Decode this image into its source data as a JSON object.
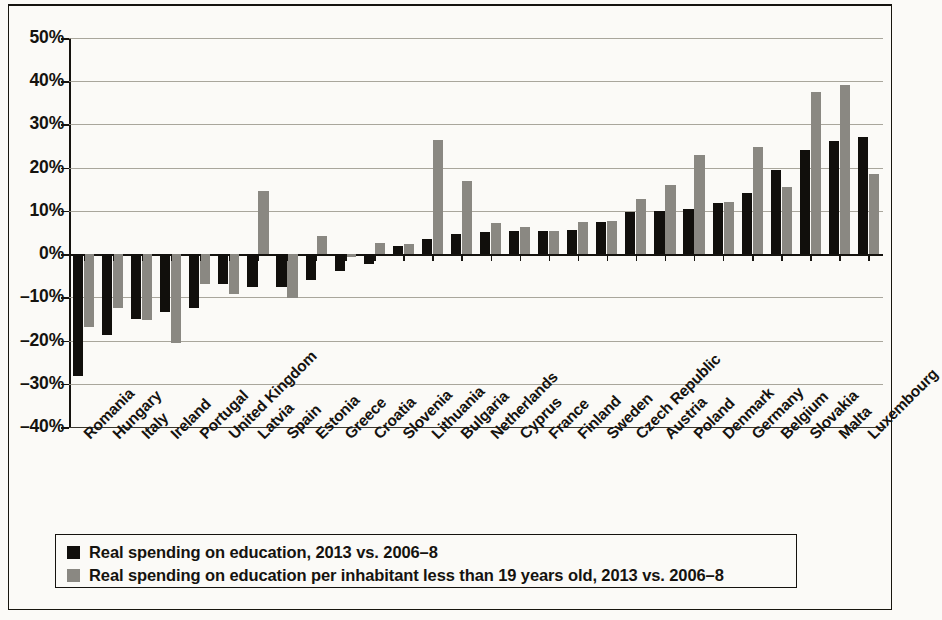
{
  "chart_data": {
    "type": "bar",
    "title": "",
    "xlabel": "",
    "ylabel": "",
    "ylim": [
      -40,
      50
    ],
    "ytick_step": 10,
    "ytick_labels": [
      "50%",
      "40%",
      "30%",
      "20%",
      "10%",
      "0%",
      "-10%",
      "-20%",
      "-30%",
      "-40%"
    ],
    "ytick_values": [
      50,
      40,
      30,
      20,
      10,
      0,
      -10,
      -20,
      -30,
      -40
    ],
    "grid": true,
    "legend_position": "bottom",
    "orientation": "vertical",
    "categories": [
      "Romania",
      "Hungary",
      "Italy",
      "Ireland",
      "Portugal",
      "United Kingdom",
      "Latvia",
      "Spain",
      "Estonia",
      "Greece",
      "Croatia",
      "Slovenia",
      "Lithuania",
      "Bulgaria",
      "Netherlands",
      "Cyprus",
      "France",
      "Finland",
      "Sweden",
      "Czech Republic",
      "Austria",
      "Poland",
      "Denmark",
      "Germany",
      "Belgium",
      "Slovakia",
      "Malta",
      "Luxembourg"
    ],
    "series": [
      {
        "name": "Real spending on education, 2013 vs. 2006-8",
        "color": "#110f0c",
        "values": [
          -28.2,
          -18.6,
          -15.0,
          -13.5,
          -12.5,
          -7.0,
          -7.5,
          -7.5,
          -6.0,
          -3.8,
          -2.3,
          1.8,
          3.5,
          4.6,
          5.1,
          5.4,
          5.4,
          5.5,
          7.4,
          9.8,
          10.0,
          10.5,
          11.9,
          14.2,
          19.4,
          24.2,
          26.1,
          27.1
        ]
      },
      {
        "name": "Real spending on education per inhabitant less than 19 years old, 2013 vs. 2006-8",
        "color": "#8a8882",
        "values": [
          -16.8,
          -12.4,
          -15.3,
          -20.6,
          -6.9,
          -9.2,
          14.5,
          -10.2,
          4.2,
          -0.6,
          2.6,
          2.3,
          26.4,
          17.0,
          7.2,
          6.2,
          5.4,
          7.5,
          7.7,
          12.8,
          16.0,
          23.0,
          12.1,
          24.8,
          15.5,
          37.5,
          39.2,
          18.6
        ]
      }
    ]
  },
  "legend": {
    "entries": [
      {
        "swatch": "dark",
        "label": "Real spending on education, 2013 vs. 2006–8"
      },
      {
        "swatch": "gray",
        "label": "Real spending on education per inhabitant less than 19 years old, 2013 vs. 2006–8"
      }
    ]
  }
}
